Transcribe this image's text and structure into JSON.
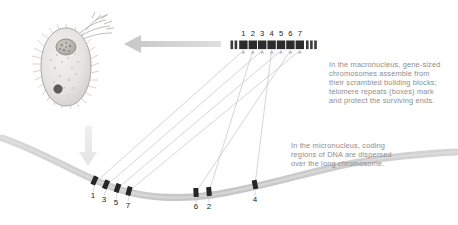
{
  "figure": {
    "organism_label": "ciliate cell",
    "background_color": "#ffffff",
    "text_color": "#8d8d8d",
    "segment_color": "#2b2b2b",
    "telomere_color": "#3a3a3a",
    "chromosome_color": "#c9c9c9",
    "arrow_color": "#cfcfcf",
    "connector_color": "#b9bcc4"
  },
  "captions": {
    "macronucleus": "In the macronucleus, gene-sized\nchromosomes assemble from\ntheir scrambled building blocks;\ntelomere repeats (boxes) mark\nand protect the surviving ends.",
    "micronucleus": "In the micronucleus, coding\nregions of DNA are dispersed\nover the long chromosome."
  },
  "macronucleus_chromosome": {
    "label": "gene-sized chromosome",
    "order": [
      1,
      2,
      3,
      4,
      5,
      6,
      7
    ],
    "numbers": [
      "1",
      "2",
      "3",
      "4",
      "5",
      "6",
      "7"
    ],
    "left_telomere_boxes": 2,
    "right_telomere_boxes": 3
  },
  "micronucleus_chromosome": {
    "label": "long chromosome",
    "clusters": [
      {
        "name": "left-cluster",
        "numbers": [
          "1",
          "3",
          "5",
          "7"
        ]
      },
      {
        "name": "middle-cluster",
        "numbers": [
          "6",
          "2"
        ]
      },
      {
        "name": "right-cluster",
        "numbers": [
          "4"
        ]
      }
    ],
    "all_numbers": [
      "1",
      "3",
      "5",
      "7",
      "6",
      "2",
      "4"
    ]
  },
  "arrows": [
    {
      "name": "arrow-to-cell",
      "direction": "left"
    },
    {
      "name": "arrow-to-chromosome",
      "direction": "down"
    }
  ],
  "cell": {
    "name": "ciliate-cell",
    "features": [
      "macronucleus",
      "micronucleus",
      "cilia"
    ]
  }
}
